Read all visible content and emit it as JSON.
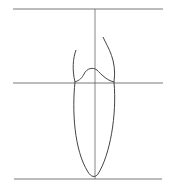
{
  "diagram": {
    "type": "line-drawing",
    "stroke_color": "#555555",
    "background": "#ffffff",
    "elements": [
      {
        "name": "top-horizontal-line",
        "y": 9,
        "x1": 13,
        "x2": 163
      },
      {
        "name": "middle-horizontal-line",
        "y": 83,
        "x1": 13,
        "x2": 163
      },
      {
        "name": "bottom-horizontal-line",
        "y": 179,
        "x1": 14,
        "x2": 162
      },
      {
        "name": "vertical-center-line",
        "x": 95,
        "y1": 9,
        "y2": 179
      },
      {
        "name": "elongated-oval-root",
        "description": "narrow U-shaped outline from middle line to bottom line"
      },
      {
        "name": "crown-outline",
        "description": "tooth crown with two flaring sides and bumped occlusal edge"
      }
    ]
  }
}
